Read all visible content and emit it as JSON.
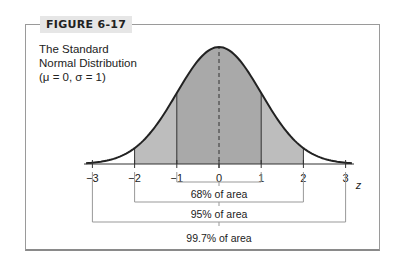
{
  "figure": {
    "label": "FIGURE 6-17",
    "caption_lines": [
      "The Standard",
      "Normal Distribution",
      "(μ = 0, σ = 1)"
    ]
  },
  "chart_data": {
    "type": "area",
    "title": "The Standard Normal Distribution (μ = 0, σ = 1)",
    "xlabel": "z",
    "ylabel": "",
    "xlim": [
      -3,
      3
    ],
    "x_ticks": [
      -3,
      -2,
      -1,
      0,
      1,
      2,
      3
    ],
    "x_tick_labels": [
      "−3",
      "−2",
      "−1",
      "0",
      "1",
      "2",
      "3"
    ],
    "curve": "standard normal pdf",
    "mean": 0,
    "sd": 1,
    "mean_line": "dashed",
    "shaded_regions": [
      {
        "from": -2,
        "to": 2,
        "shade": "light gray"
      },
      {
        "from": -1,
        "to": 1,
        "shade": "medium gray"
      }
    ],
    "annotations": [
      {
        "range": [
          -1,
          1
        ],
        "text": "68% of area"
      },
      {
        "range": [
          -2,
          2
        ],
        "text": "95% of area"
      },
      {
        "range": [
          -3,
          3
        ],
        "text": "99.7% of area"
      }
    ],
    "grid": false,
    "legend": "none"
  }
}
